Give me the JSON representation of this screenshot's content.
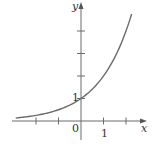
{
  "chart_data": {
    "type": "line",
    "title": "",
    "function": "y = 2^x",
    "xlabel": "x",
    "ylabel": "y",
    "xlim": [
      -3.0,
      2.8
    ],
    "ylim": [
      -0.9,
      5.2
    ],
    "x_ticks": [
      -2,
      -1,
      0,
      1,
      2
    ],
    "y_ticks": [
      1,
      2,
      3,
      4
    ],
    "tick_labels": {
      "origin": "0",
      "x_one": "1",
      "y_one": "1"
    },
    "grid": false,
    "legend": null,
    "series": [
      {
        "name": "y = 2^x",
        "x": [
          -2.9,
          -2,
          -1,
          0,
          1,
          2,
          2.25
        ],
        "values": [
          0.13,
          0.25,
          0.5,
          1,
          2,
          4,
          4.76
        ]
      }
    ],
    "colors": {
      "axis": "#6b6b6b",
      "curve": "#6a6a6a",
      "text": "#333333"
    }
  }
}
